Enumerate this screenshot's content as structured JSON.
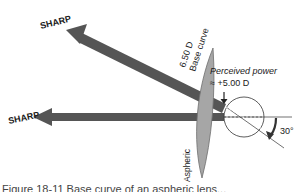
{
  "diagram": {
    "labels": {
      "sharp_top": "SHARP",
      "sharp_bottom": "SHARP",
      "base_curve_line1": "6.50 D",
      "base_curve_line2": "Base curve",
      "perceived_line1": "Perceived power",
      "perceived_line2": "≈ +5.00 D",
      "lens_label": "Aspheric",
      "angle_label": "30°"
    },
    "colors": {
      "arrow": "#555555",
      "lens_fill": "#a6a6a6",
      "lens_stroke": "#6e6e6e",
      "text": "#1a1a1a"
    },
    "angle_degrees": 30
  },
  "caption": {
    "text": "Figure 18-11  Base curve of an aspheric lens..."
  }
}
